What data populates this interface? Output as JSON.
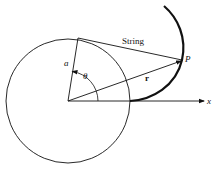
{
  "diagram": {
    "labels": {
      "string": "String",
      "point": "P",
      "radius_vector": "r",
      "radius": "a",
      "angle": "θ",
      "axis": "x"
    },
    "colors": {
      "stroke": "#111111",
      "background": "#ffffff"
    },
    "geometry": {
      "circle_center": [
        68,
        101
      ],
      "circle_radius": 62,
      "tangent_point": [
        78,
        38
      ],
      "point_P": [
        182,
        60
      ],
      "axis_end": [
        205,
        101
      ]
    }
  }
}
